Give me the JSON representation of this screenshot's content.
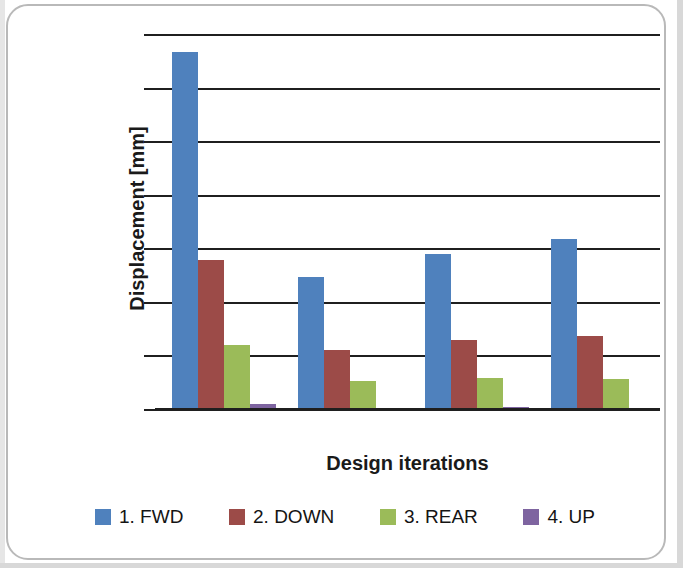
{
  "chart_data": {
    "type": "bar",
    "title": "",
    "subtitle": "",
    "xlabel": "Design iterations",
    "ylabel": "Displacement [mm]",
    "categories": [
      "1",
      "2",
      "3",
      "4"
    ],
    "tick_labels": [],
    "grid": true,
    "gridlines_count": 8,
    "y_axis_units": "gridline units (axis values not labeled)",
    "ylim": [
      0,
      7
    ],
    "legend_position": "bottom",
    "series": [
      {
        "name": "1. FWD",
        "color": "#4F81BD",
        "values": [
          6.66,
          2.46,
          2.89,
          3.17
        ]
      },
      {
        "name": "2. DOWN",
        "color": "#9C4B48",
        "values": [
          2.78,
          1.1,
          1.29,
          1.36
        ]
      },
      {
        "name": "3. REAR",
        "color": "#9BBB59",
        "values": [
          1.19,
          0.52,
          0.58,
          0.56
        ]
      },
      {
        "name": "4. UP",
        "color": "#7E64A0",
        "values": [
          0.09,
          0.02,
          0.03,
          0.02
        ]
      }
    ]
  },
  "axes": {
    "y_title": "Displacement [mm]",
    "x_title": "Design iterations"
  },
  "legend": {
    "items": [
      {
        "label": "1. FWD",
        "color": "#4F81BD"
      },
      {
        "label": "2. DOWN",
        "color": "#9C4B48"
      },
      {
        "label": "3. REAR",
        "color": "#9BBB59"
      },
      {
        "label": "4. UP",
        "color": "#7E64A0"
      }
    ]
  },
  "colors": {
    "gridline": "#1f1f1f",
    "axis": "#1f1f1f",
    "background": "#ffffff",
    "frame": "#b9b9b9"
  }
}
